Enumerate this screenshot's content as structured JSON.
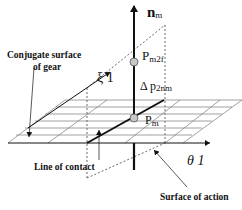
{
  "diagram": {
    "axis_normal": {
      "label_main": "n",
      "label_sub": "m"
    },
    "point_upper": {
      "label_main": "P",
      "label_sub": "m2f"
    },
    "point_lower": {
      "label_main": "P",
      "label_sub": "m"
    },
    "delta_label": {
      "prefix": "Δ p",
      "sub": "2nm"
    },
    "axis_xi": {
      "label": "ξ 1"
    },
    "axis_theta": {
      "label": "θ 1"
    },
    "callouts": {
      "conjugate_surface_line1": "Conjugate surface",
      "conjugate_surface_line2": "of gear",
      "line_of_contact": "Line of contact",
      "surface_of_action": "Surface of action"
    },
    "colors": {
      "line": "#111111",
      "grid": "#7a7a7a",
      "point_fill": "#c8c8c8",
      "background": "#ffffff"
    }
  }
}
